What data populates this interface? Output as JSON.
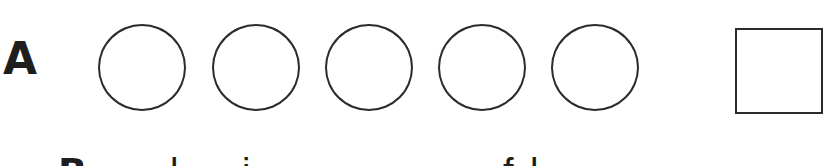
{
  "row_a": {
    "label": "A",
    "circles": [
      {
        "left": 98
      },
      {
        "left": 212
      },
      {
        "left": 325
      },
      {
        "left": 438
      },
      {
        "left": 551
      }
    ],
    "answer_box": {
      "shape": "square"
    }
  },
  "row_b_partial": {
    "label": "B",
    "prefix_glyph": "-",
    "visible_glyph_fragments": [
      "B",
      "l",
      "i",
      "f",
      "l"
    ]
  },
  "colors": {
    "stroke": "#2b2b2b",
    "text": "#1e1e1e",
    "background": "#ffffff"
  }
}
